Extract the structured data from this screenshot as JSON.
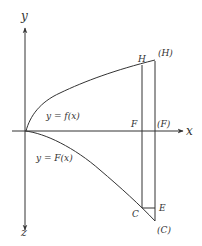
{
  "diagram": {
    "axes": {
      "x_label": "x",
      "y_label": "y",
      "z_label": "z"
    },
    "curves": {
      "upper": "y = f(x)",
      "lower": "y = F(x)"
    },
    "points": {
      "H": "H",
      "H_image": "(H)",
      "F": "F",
      "F_image": "(F)",
      "C": "C",
      "C_image": "(C)",
      "E": "E"
    }
  }
}
